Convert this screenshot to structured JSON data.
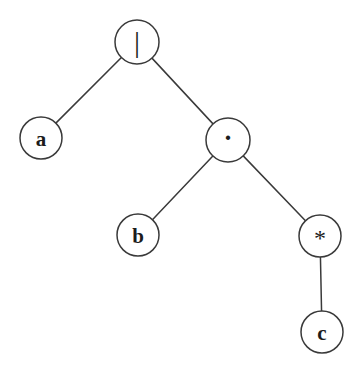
{
  "figure": {
    "kind": "syntax-tree",
    "expression": "a | b . c*",
    "background_color": "#ffffff",
    "stroke_color": "#3a3a3a",
    "label_color": "#1c1c1c"
  },
  "nodes": [
    {
      "id": "root",
      "label": "|",
      "name": "alternation",
      "cx": 137,
      "cy": 42,
      "r": 22,
      "label_dy": -1,
      "style": "op-bar"
    },
    {
      "id": "a",
      "label": "a",
      "name": "symbol-a",
      "cx": 41,
      "cy": 138,
      "r": 21,
      "label_dy": 1,
      "style": "leaf"
    },
    {
      "id": "concat",
      "label": "·",
      "name": "concatenation",
      "cx": 228,
      "cy": 140,
      "r": 22,
      "label_dy": -2,
      "style": "op-dot"
    },
    {
      "id": "b",
      "label": "b",
      "name": "symbol-b",
      "cx": 138,
      "cy": 235,
      "r": 21,
      "label_dy": 1,
      "style": "leaf"
    },
    {
      "id": "star",
      "label": "*",
      "name": "kleene-star",
      "cx": 320,
      "cy": 236,
      "r": 21,
      "label_dy": 2,
      "style": "op-star"
    },
    {
      "id": "c",
      "label": "c",
      "name": "symbol-c",
      "cx": 322,
      "cy": 332,
      "r": 21,
      "label_dy": 1,
      "style": "leaf"
    }
  ],
  "edges": [
    {
      "from": "root",
      "to": "a",
      "name": "edge-root-a"
    },
    {
      "from": "root",
      "to": "concat",
      "name": "edge-root-concat"
    },
    {
      "from": "concat",
      "to": "b",
      "name": "edge-concat-b"
    },
    {
      "from": "concat",
      "to": "star",
      "name": "edge-concat-star"
    },
    {
      "from": "star",
      "to": "c",
      "name": "edge-star-c"
    }
  ]
}
